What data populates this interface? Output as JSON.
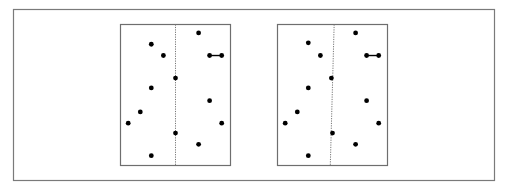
{
  "figure": {
    "colors": {
      "frame": "#7a7a7a",
      "panel": "#6e6e6e",
      "point": "#000000",
      "divider": "#777777"
    },
    "panels": [
      {
        "name": "left-panel",
        "divider": {
          "style": "dotted",
          "top_x": 0.5,
          "bottom_x": 0.5
        },
        "points": [
          [
            0.71,
            0.06
          ],
          [
            0.28,
            0.14
          ],
          [
            0.39,
            0.22
          ],
          [
            0.81,
            0.22
          ],
          [
            0.92,
            0.22
          ],
          [
            0.5,
            0.38
          ],
          [
            0.28,
            0.45
          ],
          [
            0.81,
            0.54
          ],
          [
            0.18,
            0.62
          ],
          [
            0.07,
            0.7
          ],
          [
            0.92,
            0.7
          ],
          [
            0.5,
            0.77
          ],
          [
            0.71,
            0.85
          ],
          [
            0.28,
            0.93
          ]
        ],
        "links": [
          [
            3,
            4
          ]
        ]
      },
      {
        "name": "right-panel",
        "divider": {
          "style": "dotted",
          "top_x": 0.515,
          "bottom_x": 0.48
        },
        "points": [
          [
            0.71,
            0.06
          ],
          [
            0.28,
            0.13
          ],
          [
            0.39,
            0.22
          ],
          [
            0.81,
            0.22
          ],
          [
            0.92,
            0.22
          ],
          [
            0.49,
            0.38
          ],
          [
            0.28,
            0.45
          ],
          [
            0.81,
            0.54
          ],
          [
            0.18,
            0.62
          ],
          [
            0.07,
            0.7
          ],
          [
            0.92,
            0.7
          ],
          [
            0.5,
            0.77
          ],
          [
            0.71,
            0.85
          ],
          [
            0.28,
            0.93
          ]
        ],
        "links": [
          [
            3,
            4
          ]
        ]
      }
    ]
  }
}
